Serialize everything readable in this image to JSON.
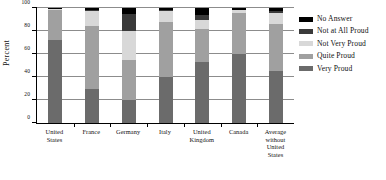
{
  "chart_data": {
    "type": "bar",
    "subtype": "stacked-bar-100",
    "title": "",
    "xlabel": "",
    "ylabel": "Percent",
    "ylim": [
      0,
      100
    ],
    "yticks": [
      0,
      20,
      40,
      60,
      80,
      100
    ],
    "ytick_labels": [
      "0",
      "20",
      "40",
      "60",
      "80",
      "100"
    ],
    "grid": true,
    "legend_position": "right",
    "categories": [
      "United States",
      "France",
      "Germany",
      "Italy",
      "United Kingdom",
      "Canada",
      "Average without United States"
    ],
    "category_lines": [
      [
        "United",
        "States"
      ],
      [
        "France"
      ],
      [
        "Germany"
      ],
      [
        "Italy"
      ],
      [
        "United",
        "Kingdom"
      ],
      [
        "Canada"
      ],
      [
        "Average",
        "without",
        "United",
        "States"
      ]
    ],
    "series": [
      {
        "name": "Very Proud",
        "color": "#6b6b6b",
        "values": [
          72,
          30,
          20,
          40,
          53,
          60,
          45
        ]
      },
      {
        "name": "Quite Proud",
        "color": "#a0a0a0",
        "values": [
          26,
          54,
          35,
          48,
          29,
          36,
          41
        ]
      },
      {
        "name": "Not Very Proud",
        "color": "#d8d8d8",
        "values": [
          1,
          13,
          25,
          9,
          8,
          2,
          10
        ]
      },
      {
        "name": "Not at All Proud",
        "color": "#3a3a3a",
        "values": [
          0,
          1,
          15,
          1,
          4,
          0,
          1
        ]
      },
      {
        "name": "No Answer",
        "color": "#000000",
        "values": [
          1,
          2,
          5,
          2,
          6,
          2,
          3
        ]
      }
    ],
    "legend_order": [
      "No Answer",
      "Not at All Proud",
      "Not Very Proud",
      "Quite Proud",
      "Very Proud"
    ]
  },
  "legend": {
    "items": [
      {
        "label": "No Answer",
        "color": "#000000"
      },
      {
        "label": "Not at All Proud",
        "color": "#3a3a3a"
      },
      {
        "label": "Not Very Proud",
        "color": "#d8d8d8"
      },
      {
        "label": "Quite Proud",
        "color": "#a0a0a0"
      },
      {
        "label": "Very Proud",
        "color": "#6b6b6b"
      }
    ]
  },
  "axis": {
    "y_title": "Percent"
  }
}
